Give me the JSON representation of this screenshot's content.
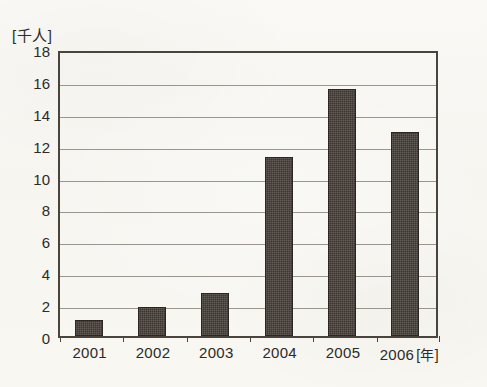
{
  "chart_data": {
    "type": "bar",
    "title": "",
    "subtitle": "",
    "categories": [
      "2001",
      "2002",
      "2003",
      "2004",
      "2005",
      "2006"
    ],
    "values": [
      1.0,
      1.8,
      2.7,
      11.2,
      15.5,
      12.8
    ],
    "xlabel": "",
    "ylabel": "",
    "x_unit_label": "[年]",
    "y_unit_label": "[千人]",
    "ylim": [
      0,
      18
    ],
    "ytick_step": 2,
    "yticks": [
      "0",
      "2",
      "4",
      "6",
      "8",
      "10",
      "12",
      "14",
      "16",
      "18"
    ],
    "grid": true,
    "grid_axis": "y",
    "legend": false,
    "legend_position": "none",
    "bar_color": "#3d352f",
    "background_color": "#f7f6f2",
    "gridline_color": "#9b968d",
    "axis_color": "#4a443d",
    "text_color": "#2e2a26"
  }
}
